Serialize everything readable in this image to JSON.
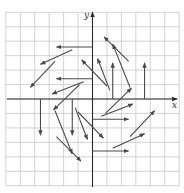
{
  "figure": {
    "type": "vector-field",
    "colors": {
      "background": "#ffffff",
      "grid": "#c8c8c8",
      "axes": "#2a2a2a",
      "vectors": "#4a4a4a"
    },
    "axes": {
      "x_label": "x",
      "y_label": "y"
    },
    "grid": {
      "x_min": -6,
      "x_max": 6,
      "y_min": -6,
      "y_max": 6,
      "step": 1
    }
  },
  "chart_data": {
    "type": "vector-field",
    "title": "",
    "xlabel": "x",
    "ylabel": "y",
    "xlim": [
      -6,
      6
    ],
    "ylim": [
      -6,
      6
    ],
    "grid": true,
    "note": "Arrows given as [x1, y1, x2, y2] in grid units (origin at center, 1 unit per grid cell); tail -> head.",
    "vectors": [
      {
        "from": [
          0,
          3.6
        ],
        "to": [
          -2.5,
          3.6
        ]
      },
      {
        "from": [
          -1.4,
          3.4
        ],
        "to": [
          -3.6,
          2.4
        ]
      },
      {
        "from": [
          -2.6,
          2.6
        ],
        "to": [
          -4.3,
          0.8
        ]
      },
      {
        "from": [
          0,
          1.4
        ],
        "to": [
          -2.5,
          1.4
        ]
      },
      {
        "from": [
          -0.6,
          1.2
        ],
        "to": [
          -2.8,
          0.35
        ]
      },
      {
        "from": [
          -0.9,
          1.0
        ],
        "to": [
          -2.7,
          -0.75
        ]
      },
      {
        "from": [
          -3.6,
          0
        ],
        "to": [
          -3.6,
          -2.5
        ]
      },
      {
        "from": [
          -2.6,
          -0.8
        ],
        "to": [
          -1.4,
          -3.8
        ]
      },
      {
        "from": [
          -2.5,
          -2.6
        ],
        "to": [
          -0.8,
          -4.3
        ]
      },
      {
        "from": [
          -1.4,
          0
        ],
        "to": [
          -1.4,
          -2.5
        ]
      },
      {
        "from": [
          -1.2,
          -0.6
        ],
        "to": [
          -0.35,
          -2.8
        ]
      },
      {
        "from": [
          -1.0,
          -0.9
        ],
        "to": [
          0.75,
          -2.7
        ]
      },
      {
        "from": [
          0,
          -1.4
        ],
        "to": [
          2.5,
          -1.4
        ]
      },
      {
        "from": [
          0.6,
          -1.2
        ],
        "to": [
          2.8,
          -0.35
        ]
      },
      {
        "from": [
          0.9,
          -1.0
        ],
        "to": [
          2.7,
          0.75
        ]
      },
      {
        "from": [
          0,
          -3.6
        ],
        "to": [
          2.5,
          -3.6
        ]
      },
      {
        "from": [
          1.4,
          -3.4
        ],
        "to": [
          3.6,
          -2.4
        ]
      },
      {
        "from": [
          2.6,
          -2.6
        ],
        "to": [
          4.3,
          -0.8
        ]
      },
      {
        "from": [
          3.6,
          0
        ],
        "to": [
          3.6,
          2.5
        ]
      },
      {
        "from": [
          2.6,
          0.8
        ],
        "to": [
          1.4,
          3.8
        ]
      },
      {
        "from": [
          2.5,
          2.6
        ],
        "to": [
          0.8,
          4.3
        ]
      },
      {
        "from": [
          1.4,
          0
        ],
        "to": [
          1.4,
          2.5
        ]
      },
      {
        "from": [
          1.2,
          0.6
        ],
        "to": [
          0.35,
          2.8
        ]
      },
      {
        "from": [
          1.0,
          0.9
        ],
        "to": [
          -0.75,
          2.7
        ]
      }
    ]
  }
}
